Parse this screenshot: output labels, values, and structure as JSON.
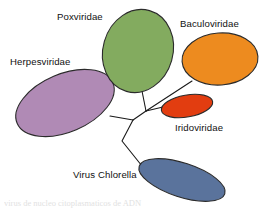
{
  "figure": {
    "type": "unrooted-phylogenetic-tree",
    "background": "#ffffff",
    "caption_partial": "virus de nucleo citoplasmaticos de ADN"
  },
  "palette": {
    "purple": "#b08ab5",
    "green": "#83ab5f",
    "orange": "#ed8b1f",
    "red_orange": "#e23d10",
    "blue": "#5a739c",
    "outline": "#2b2b2b",
    "branch": "#1a1a1a",
    "label": "#111111"
  },
  "taxa": [
    {
      "id": "herpesviridae",
      "label": "Herpesviridae",
      "color": "#b08ab5",
      "label_x": 10,
      "label_y": 65,
      "ellipse": {
        "cx": 65,
        "cy": 103,
        "rx": 52,
        "ry": 29,
        "rotate": -23
      }
    },
    {
      "id": "poxviridae",
      "label": "Poxviridae",
      "color": "#83ab5f",
      "label_x": 57,
      "label_y": 20,
      "ellipse": {
        "cx": 138,
        "cy": 51,
        "rx": 35,
        "ry": 42,
        "rotate": 16
      }
    },
    {
      "id": "baculoviridae",
      "label": "Baculoviridae",
      "color": "#ed8b1f",
      "label_x": 180,
      "label_y": 27,
      "ellipse": {
        "cx": 220,
        "cy": 59,
        "rx": 38,
        "ry": 26,
        "rotate": -4
      }
    },
    {
      "id": "iridoviridae",
      "label": "Iridoviridae",
      "color": "#e23d10",
      "label_x": 175,
      "label_y": 131,
      "ellipse": {
        "cx": 187,
        "cy": 106,
        "rx": 26,
        "ry": 11,
        "rotate": -10
      }
    },
    {
      "id": "virus-chlorella",
      "label": "Virus Chlorella",
      "color": "#5a739c",
      "label_x": 73,
      "label_y": 178,
      "ellipse": {
        "cx": 182,
        "cy": 180,
        "rx": 45,
        "ry": 17,
        "rotate": 18
      }
    }
  ],
  "branches": [
    {
      "id": "branch-herpesviridae",
      "from_taxon": "herpesviridae",
      "path": "M 110 116 L 133 120"
    },
    {
      "id": "branch-poxviridae",
      "from_taxon": "poxviridae",
      "path": "M 142 91 L 146 111"
    },
    {
      "id": "branch-baculoviridae",
      "from_taxon": "baculoviridae",
      "path": "M 192 81 L 146 111"
    },
    {
      "id": "branch-iridoviridae",
      "from_taxon": "iridoviridae",
      "path": "M 163 107 L 146 111"
    },
    {
      "id": "branch-internal",
      "from_taxon": "node",
      "path": "M 146 111 L 133 120"
    },
    {
      "id": "branch-virus-chlorella",
      "from_taxon": "virus-chlorella",
      "path": "M 133 120 L 122 141 L 146 171"
    }
  ]
}
